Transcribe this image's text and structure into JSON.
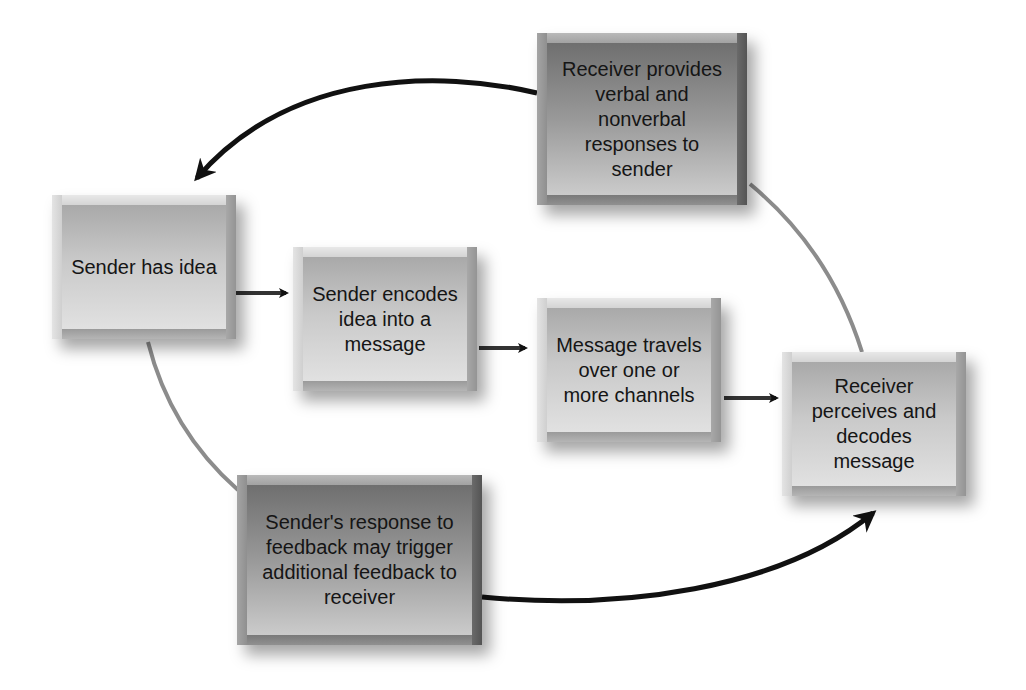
{
  "diagram": {
    "type": "communication-process-cycle",
    "nodes": [
      {
        "id": "sender-idea",
        "label": "Sender has idea",
        "lines": [
          "Sender has",
          "idea"
        ],
        "shade": "light"
      },
      {
        "id": "sender-encodes",
        "label": "Sender encodes idea into a message",
        "lines": [
          "Sender",
          "encodes idea",
          "into a",
          "message"
        ],
        "shade": "light"
      },
      {
        "id": "message-travels",
        "label": "Message travels over one or more channels",
        "lines": [
          "Message",
          "travels over",
          "one or more",
          "channels"
        ],
        "shade": "light"
      },
      {
        "id": "receiver-decodes",
        "label": "Receiver perceives and decodes message",
        "lines": [
          "Receiver",
          "perceives and",
          "decodes",
          "message"
        ],
        "shade": "light"
      },
      {
        "id": "receiver-feedback",
        "label": "Receiver provides verbal and nonverbal responses to sender",
        "lines": [
          "Receiver",
          "provides verbal",
          "and nonverbal",
          "responses to",
          "sender"
        ],
        "shade": "dark"
      },
      {
        "id": "sender-response",
        "label": "Sender's response to feedback may trigger additional feedback to receiver",
        "lines": [
          "Sender's response",
          "to feedback may",
          "trigger additional",
          "feedback to",
          "receiver"
        ],
        "shade": "dark"
      }
    ],
    "edges": [
      {
        "from": "sender-idea",
        "to": "sender-encodes",
        "style": "straight-arrow"
      },
      {
        "from": "sender-encodes",
        "to": "message-travels",
        "style": "straight-arrow"
      },
      {
        "from": "message-travels",
        "to": "receiver-decodes",
        "style": "straight-arrow"
      },
      {
        "from": "receiver-decodes",
        "to": "receiver-feedback",
        "style": "gray-curve"
      },
      {
        "from": "receiver-feedback",
        "to": "sender-idea",
        "style": "black-curved-arrow"
      },
      {
        "from": "sender-idea",
        "to": "sender-response",
        "style": "gray-curve"
      },
      {
        "from": "sender-response",
        "to": "receiver-decodes",
        "style": "black-curved-arrow"
      }
    ],
    "colors": {
      "background": "#ffffff",
      "arrow": "#111111",
      "connector_gray": "#8c8c8c",
      "text": "#151515"
    }
  }
}
